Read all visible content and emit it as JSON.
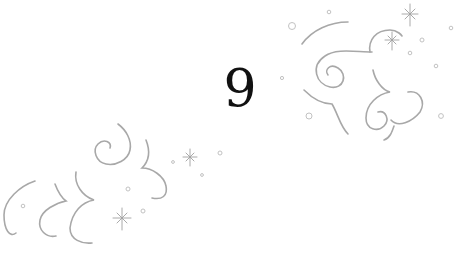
{
  "card": {
    "numeral": "9",
    "colors": {
      "background": "#ffffff",
      "numeral": "#111111",
      "ornament_stroke": "#a8a8a8",
      "dots": "#c2c2c2"
    },
    "ornaments": [
      {
        "name": "swirl-cloud-top-right",
        "region": "upper right"
      },
      {
        "name": "swirl-cloud-bottom-left",
        "region": "lower left"
      },
      {
        "name": "sparkles",
        "count": 4
      }
    ]
  }
}
